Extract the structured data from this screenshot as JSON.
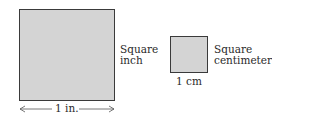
{
  "square_inch": {
    "label_line1": "Square",
    "label_line2": "inch",
    "dimension": "1 in."
  },
  "square_centimeter": {
    "label_line1": "Square",
    "label_line2": "centimeter",
    "dimension": "1 cm"
  },
  "colors": {
    "fill": "#d4d4d4",
    "stroke": "#3a3a3a"
  }
}
